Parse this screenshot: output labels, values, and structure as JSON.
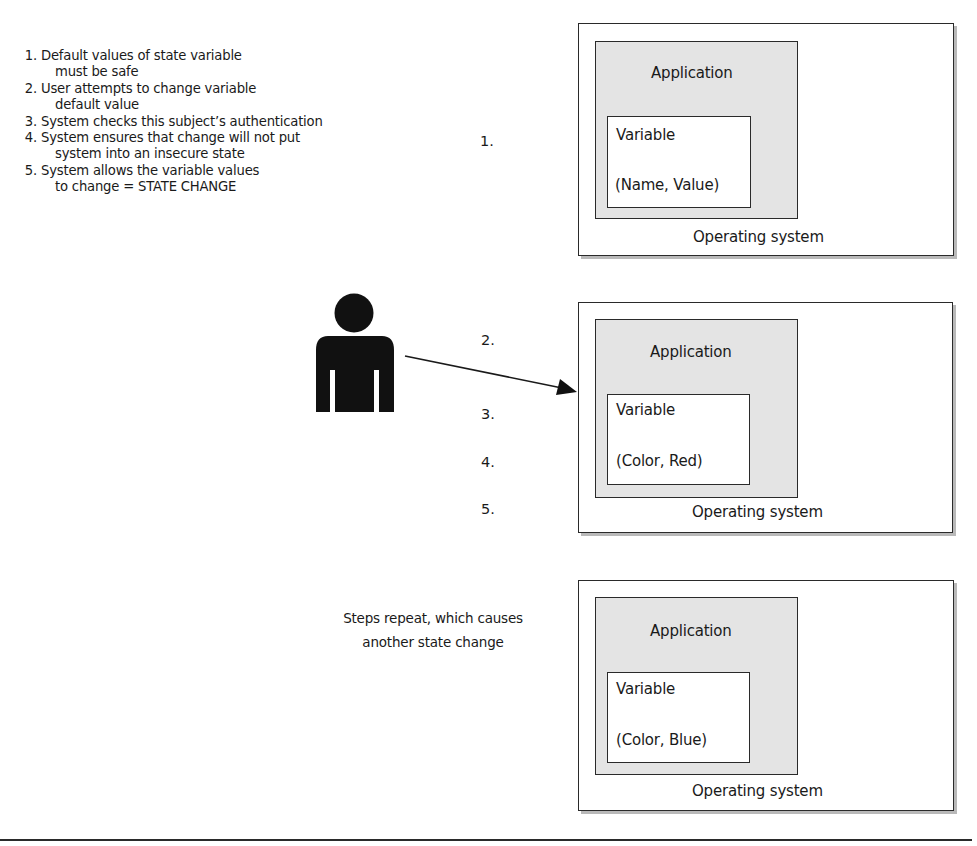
{
  "steps": [
    {
      "num": "1.",
      "line1": "Default values of state variable",
      "line2": "must be safe"
    },
    {
      "num": "2.",
      "line1": "User attempts to change variable",
      "line2": "default value"
    },
    {
      "num": "3.",
      "line1": "System checks this subject’s authentication",
      "line2": ""
    },
    {
      "num": "4.",
      "line1": "System ensures that change will not put",
      "line2": "system into an insecure state"
    },
    {
      "num": "5.",
      "line1": "System allows the variable values",
      "line2": "to change = STATE CHANGE"
    }
  ],
  "panels": [
    {
      "step_label": "1.",
      "os_label": "Operating system",
      "app_label": "Application",
      "var_label": "Variable",
      "var_value": "(Name, Value)"
    },
    {
      "step_labels": [
        "2.",
        "3.",
        "4.",
        "5."
      ],
      "os_label": "Operating system",
      "app_label": "Application",
      "var_label": "Variable",
      "var_value": "(Color, Red)"
    },
    {
      "os_label": "Operating system",
      "app_label": "Application",
      "var_label": "Variable",
      "var_value": "(Color, Blue)"
    }
  ],
  "repeat_caption": {
    "line1": "Steps repeat, which causes",
    "line2": "another state change"
  },
  "icons": {
    "user": "person-silhouette-icon",
    "arrow": "arrow-right-icon"
  },
  "colors": {
    "line": "#2a2a2a",
    "app_fill": "#e4e4e4",
    "shadow": "#b9b9b9",
    "figure": "#111111"
  }
}
